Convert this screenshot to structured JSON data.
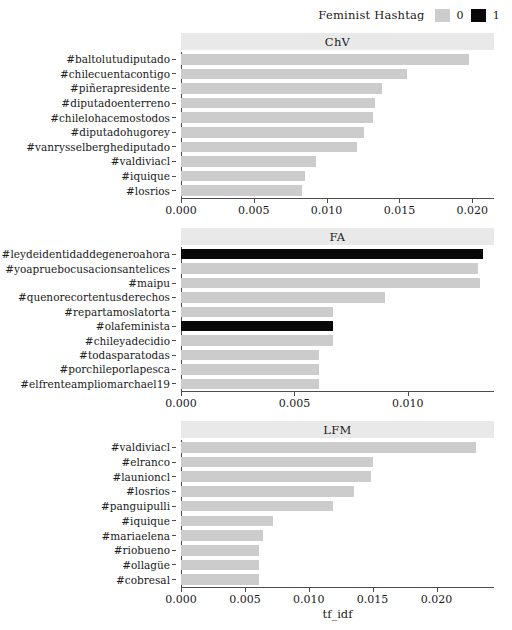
{
  "legend": {
    "title": "Feminist Hashtag",
    "entries": [
      {
        "label": "0",
        "color": "#cccccc"
      },
      {
        "label": "1",
        "color": "#080808"
      }
    ]
  },
  "axis": {
    "xlabel": "tf_idf",
    "ylabel": ""
  },
  "chart_data": {
    "type": "bar",
    "title": "",
    "xlabel": "tf_idf",
    "ylabel": "",
    "orientation": "horizontal",
    "grid": false,
    "legend_title": "Feminist Hashtag",
    "legend_position": "top-right",
    "legend_entries": [
      "0",
      "1"
    ],
    "colors": {
      "0": "#cccccc",
      "1": "#080808"
    },
    "panels": [
      {
        "name": "ChV",
        "xlim": [
          0,
          0.0215
        ],
        "xticks": [
          0.0,
          0.005,
          0.01,
          0.015,
          0.02
        ],
        "xticklabels": [
          "0.000",
          "0.005",
          "0.010",
          "0.015",
          "0.020"
        ],
        "categories": [
          "#baltolutudiputado",
          "#chilecuentacontigo",
          "#piñerapresidente",
          "#diputadoenterreno",
          "#chilelohacemostodos",
          "#diputadohugorey",
          "#vanrysselberghediputado",
          "#valdiviacl",
          "#iquique",
          "#losrios"
        ],
        "values": [
          0.0198,
          0.0155,
          0.0138,
          0.0133,
          0.0132,
          0.0126,
          0.0121,
          0.0093,
          0.0085,
          0.0083
        ],
        "feminist": [
          0,
          0,
          0,
          0,
          0,
          0,
          0,
          0,
          0,
          0
        ]
      },
      {
        "name": "FA",
        "xlim": [
          0,
          0.0138
        ],
        "xticks": [
          0.0,
          0.005,
          0.01
        ],
        "xticklabels": [
          "0.000",
          "0.005",
          "0.010"
        ],
        "categories": [
          "#leydeidentidaddegeneroahora",
          "#yoapruebocusacionsantelices",
          "#maipu",
          "#quenorecortentusderechos",
          "#repartamoslatorta",
          "#olafeminista",
          "#chileyadecidio",
          "#todasparatodas",
          "#porchileporlapesca",
          "#elfrenteampliomarchael19"
        ],
        "values": [
          0.0133,
          0.0131,
          0.0132,
          0.009,
          0.0067,
          0.0067,
          0.0067,
          0.0061,
          0.0061,
          0.0061
        ],
        "feminist": [
          1,
          0,
          0,
          0,
          0,
          1,
          0,
          0,
          0,
          0
        ]
      },
      {
        "name": "LFM",
        "xlim": [
          0,
          0.0245
        ],
        "xticks": [
          0.0,
          0.005,
          0.01,
          0.015,
          0.02
        ],
        "xticklabels": [
          "0.000",
          "0.005",
          "0.010",
          "0.015",
          "0.020"
        ],
        "categories": [
          "#valdiviacl",
          "#elranco",
          "#launioncl",
          "#losrios",
          "#panguipulli",
          "#iquique",
          "#mariaelena",
          "#riobueno",
          "#ollagüe",
          "#cobresal"
        ],
        "values": [
          0.0231,
          0.015,
          0.0149,
          0.0135,
          0.0119,
          0.0072,
          0.0064,
          0.0061,
          0.0061,
          0.0061
        ],
        "feminist": [
          0,
          0,
          0,
          0,
          0,
          0,
          0,
          0,
          0,
          0
        ]
      }
    ]
  }
}
